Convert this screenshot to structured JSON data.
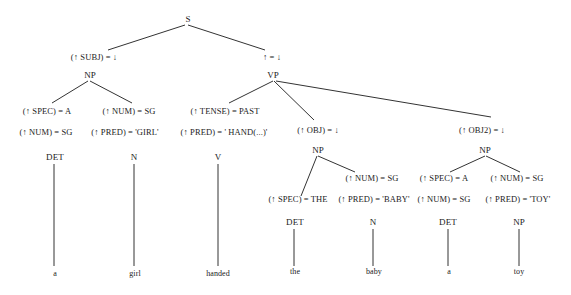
{
  "diagram": {
    "type": "f-structure annotated c-structure tree",
    "sentence": "a girl handed the baby a toy",
    "nodes": {
      "s": "S",
      "np_subj": "NP",
      "vp": "VP",
      "det1": "DET",
      "n1": "N",
      "v": "V",
      "np_obj": "NP",
      "np_obj2": "NP",
      "det2": "DET",
      "n2": "N",
      "det3": "DET",
      "np_toy": "NP"
    },
    "annotations": {
      "subj": "(↑ SUBJ) = ↓",
      "head": "↑ = ↓",
      "spec_a_1": "(↑ SPEC) = A",
      "num_sg_1": "(↑ NUM) = SG",
      "num_sg_2": "(↑ NUM) = SG",
      "pred_girl": "(↑ PRED) = 'GIRL'",
      "tense": "(↑ TENSE) = PAST",
      "pred_hand": "(↑ PRED) = ' HAND(...)'",
      "obj": "(↑ OBJ) = ↓",
      "obj2": "(↑ OBJ2) = ↓",
      "num_sg_3": "(↑ NUM) = SG",
      "spec_the": "(↑ SPEC) = THE",
      "pred_baby": "(↑ PRED) = 'BABY'",
      "spec_a_2": "(↑ SPEC) = A",
      "num_sg_4": "(↑ NUM) = SG",
      "num_sg_5": "(↑ NUM) = SG",
      "pred_toy": "(↑ PRED) = 'TOY'"
    },
    "leaves": [
      "a",
      "girl",
      "handed",
      "the",
      "baby",
      "a",
      "toy"
    ],
    "colors": {
      "line": "#333333",
      "text": "#222222",
      "background": "#ffffff"
    }
  }
}
